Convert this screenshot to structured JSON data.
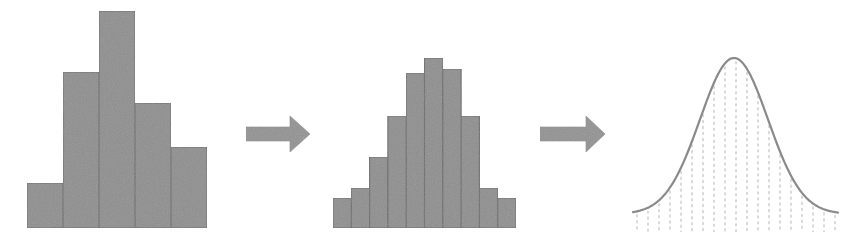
{
  "diagram": {
    "colors": {
      "bar_fill": "#8f8f8f",
      "bar_stroke": "#6e6e6e",
      "arrow_fill": "#939393",
      "curve_stroke": "#8a8a8a",
      "dash_stroke": "#b4b4b4",
      "background": "#ffffff"
    },
    "panels": [
      {
        "id": "coarse-histogram",
        "type": "histogram",
        "bins": 5,
        "x_start": 27,
        "bin_width": 36,
        "baseline": 228,
        "bar_tops": [
          183,
          72,
          11,
          103,
          147
        ]
      },
      {
        "id": "arrow-1",
        "type": "arrow",
        "direction": "right",
        "shaft": {
          "x1": 246,
          "x2": 291,
          "y1": 127,
          "y2": 141
        },
        "head": {
          "x_base": 290,
          "x_tip": 310,
          "y_top": 116,
          "y_bottom": 152
        }
      },
      {
        "id": "fine-histogram",
        "type": "histogram",
        "bins": 10,
        "x_start": 333,
        "bin_width": 18.3,
        "baseline": 228,
        "bar_tops": [
          198,
          188,
          157,
          116,
          73,
          58,
          69,
          116,
          188,
          198
        ]
      },
      {
        "id": "arrow-2",
        "type": "arrow",
        "direction": "right",
        "shaft": {
          "x1": 540,
          "x2": 587,
          "y1": 127,
          "y2": 141
        },
        "head": {
          "x_base": 586,
          "x_tip": 605,
          "y_top": 116,
          "y_bottom": 152
        }
      },
      {
        "id": "normal-curve",
        "type": "bell-curve",
        "x_start": 633,
        "x_end": 838,
        "center_x": 734,
        "peak_y": 58,
        "tail_y": 214,
        "sigma_px": 34,
        "dashed_lines": {
          "count": 19,
          "x_start": 637,
          "spacing": 11,
          "bottom_y": 232
        }
      }
    ]
  }
}
